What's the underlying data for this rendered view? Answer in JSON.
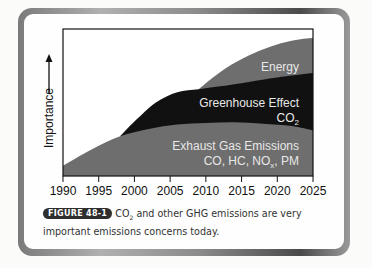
{
  "chart_data": {
    "type": "area",
    "title": "",
    "xlabel": "",
    "ylabel": "Importance",
    "ylabel_arrow": "up-arrow",
    "x_ticks": [
      1990,
      1995,
      2000,
      2005,
      2010,
      2015,
      2020,
      2025
    ],
    "xlim": [
      1990,
      2025
    ],
    "ylim": [
      0,
      100
    ],
    "grid": false,
    "legend": "none",
    "series": [
      {
        "name": "Exhaust Gas Emissions",
        "label_line1": "Exhaust Gas Emissions",
        "label_line2_parts": [
          "CO, HC, NO",
          "x",
          ", PM"
        ],
        "color": "#6e6e6e",
        "points": [
          [
            1990,
            7
          ],
          [
            1994,
            18
          ],
          [
            1998,
            27
          ],
          [
            2002,
            32
          ],
          [
            2006,
            35
          ],
          [
            2010,
            36
          ],
          [
            2014,
            36.5
          ],
          [
            2018,
            35.5
          ],
          [
            2022,
            34
          ],
          [
            2025,
            31
          ]
        ]
      },
      {
        "name": "Greenhouse Effect CO2",
        "label_line1": "Greenhouse Effect",
        "label_line2_parts": [
          "CO",
          "2",
          ""
        ],
        "color": "#111111",
        "points": [
          [
            1998,
            27
          ],
          [
            2000,
            37
          ],
          [
            2003,
            50
          ],
          [
            2006,
            57
          ],
          [
            2009,
            59
          ],
          [
            2012,
            61
          ],
          [
            2016,
            64
          ],
          [
            2020,
            67
          ],
          [
            2025,
            70
          ]
        ]
      },
      {
        "name": "Energy",
        "label_line1": "Energy",
        "color": "#6e6e6e",
        "points": [
          [
            2009,
            59
          ],
          [
            2011,
            67
          ],
          [
            2013,
            74
          ],
          [
            2016,
            82
          ],
          [
            2019,
            88
          ],
          [
            2022,
            92
          ],
          [
            2025,
            94
          ]
        ]
      }
    ]
  },
  "caption": {
    "badge": "FIGURE 48-1",
    "text_before_sub": "CO",
    "sub": "2",
    "text_after_sub": " and other GHG emissions are very important emissions concerns today."
  }
}
